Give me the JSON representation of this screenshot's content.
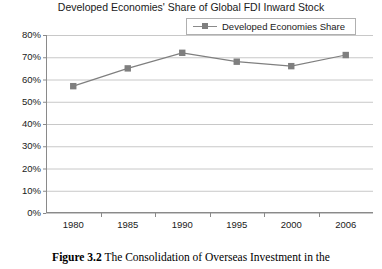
{
  "chart_data": {
    "type": "line",
    "title": "Developed Economies' Share of Global FDI Inward Stock",
    "xlabel": "",
    "ylabel": "",
    "categories": [
      "1980",
      "1985",
      "1990",
      "1995",
      "2000",
      "2006"
    ],
    "series": [
      {
        "name": "Developed Economies Share",
        "values": [
          57,
          65,
          72,
          68,
          66,
          71
        ],
        "marker": "square",
        "color": "#7f7f7f"
      }
    ],
    "ylim": [
      0,
      80
    ],
    "ytick_step": 10,
    "ytick_labels": [
      "0%",
      "10%",
      "20%",
      "30%",
      "40%",
      "50%",
      "60%",
      "70%",
      "80%"
    ],
    "ytick_values": [
      0,
      10,
      20,
      30,
      40,
      50,
      60,
      70,
      80
    ],
    "grid": "horizontal",
    "legend_position": "top-right",
    "legend_entries": [
      "Developed Economies Share"
    ],
    "value_suffix": "%"
  },
  "legend": {
    "label": "Developed Economies Share"
  },
  "caption": {
    "label": "Figure 3.2",
    "text": " The Consolidation of Overseas Investment in the"
  },
  "colors": {
    "series": "#7f7f7f",
    "grid": "#c8c8c8",
    "axis": "#8a8a8a",
    "text": "#1a1a1a"
  }
}
